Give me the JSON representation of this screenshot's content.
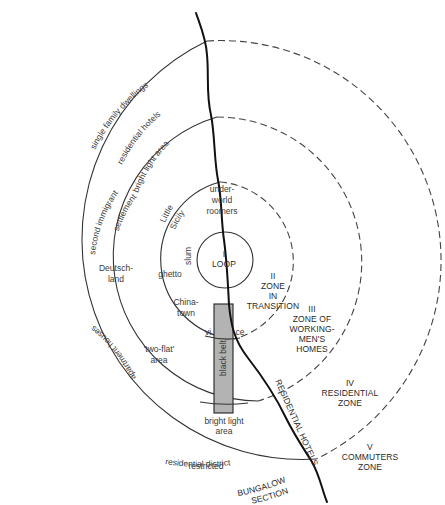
{
  "diagram": {
    "colors": {
      "line": "#333333",
      "river": "#111111",
      "black_belt_fill": "#b3b3b3",
      "text": "#3a3a3a"
    },
    "zones": [
      {
        "numeral": "I",
        "name": "LOOP"
      },
      {
        "numeral": "II",
        "name_lines": [
          "ZONE",
          "IN",
          "TRANSITION"
        ]
      },
      {
        "numeral": "III",
        "name_lines": [
          "ZONE OF",
          "WORKING-",
          "MEN'S",
          "HOMES"
        ]
      },
      {
        "numeral": "IV",
        "name_lines": [
          "RESIDENTIAL",
          "ZONE"
        ]
      },
      {
        "numeral": "V",
        "name_lines": [
          "COMMUTERS",
          "ZONE"
        ]
      }
    ],
    "labels": {
      "single_family": "single family dwellings",
      "residential_hotels_arc": "residential hotels",
      "bright_light_top": "bright light area",
      "second_immigrant_1": "second immigrant",
      "second_immigrant_2": "settlement",
      "little_sicily_1": "Little",
      "little_sicily_2": "Sicily",
      "underworld_1": "under-",
      "underworld_2": "world",
      "underworld_3": "roomers",
      "slum": "slum",
      "ghetto": "ghetto",
      "deutschland_1": "Deutsch-",
      "deutschland_2": "land",
      "chinatown_1": "China-",
      "chinatown_2": "town",
      "vi": "vi",
      "ce": "ce",
      "two_flat_1": "'two-flat'",
      "two_flat_2": "area",
      "apartment_houses": "apartment houses",
      "black_belt": "black belt",
      "bright_light_bottom_1": "bright light",
      "bright_light_bottom_2": "area",
      "residential_hotels_river": "RESIDENTIAL HOTELS",
      "restricted_1": "restricted",
      "restricted_2": "residential district",
      "bungalow_1": "BUNGALOW",
      "bungalow_2": "SECTION"
    }
  }
}
